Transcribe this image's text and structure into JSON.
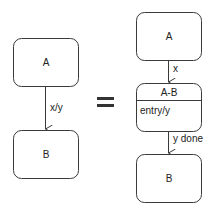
{
  "left_diagram": {
    "state_top": {
      "label": "A"
    },
    "transition": {
      "label": "x/y"
    },
    "state_bottom": {
      "label": "B"
    }
  },
  "equals": {
    "symbol": "="
  },
  "right_diagram": {
    "state_top": {
      "label": "A"
    },
    "transition_1": {
      "label": "x"
    },
    "composite_state": {
      "name": "A-B",
      "action": "entry/y"
    },
    "transition_2": {
      "label": "y done"
    },
    "state_bottom": {
      "label": "B"
    }
  },
  "colors": {
    "stroke": "#3a3a3a",
    "text": "#222222",
    "background": "#ffffff"
  }
}
